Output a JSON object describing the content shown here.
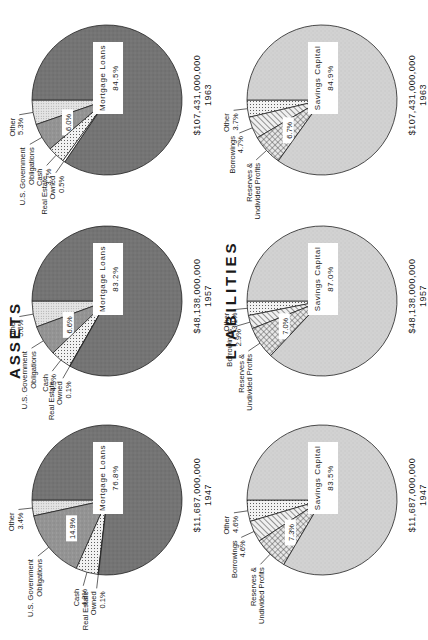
{
  "titles": {
    "assets": "ASSETS",
    "liabilities": "LIABILITIES"
  },
  "colors": {
    "mortgage": "#6e6e6e",
    "usgo": "#8f8f8f",
    "cash": "#e2e2e2",
    "real_estate": "#ffffff",
    "other_assets": "#d8d8d8",
    "savings": "#cfcfcf",
    "reserves": "#bdbdbd",
    "borrowings": "#d4d4d4",
    "other_liabilities": "#ececec",
    "outline": "#222222"
  },
  "years": [
    {
      "year": "1947",
      "total": "$11,687,000,000",
      "assets": [
        {
          "key": "other",
          "label": "Other",
          "value": 3.4,
          "text": "3.4%"
        },
        {
          "key": "usgo",
          "label": "U.S. Government Obligations",
          "value": 14.9,
          "text": "14.9%"
        },
        {
          "key": "cash",
          "label": "Cash",
          "value": 4.8,
          "text": "4.8%"
        },
        {
          "key": "real_estate",
          "label": "Real Estate Owned",
          "value": 0.1,
          "text": "0.1%"
        },
        {
          "key": "mortgage",
          "label": "Mortgage Loans",
          "value": 76.8,
          "text": "76.8%"
        }
      ],
      "liabilities": [
        {
          "key": "other",
          "label": "Other",
          "value": 4.6,
          "text": "4.6%"
        },
        {
          "key": "borrowings",
          "label": "Borrowings",
          "value": 4.6,
          "text": "4.6%"
        },
        {
          "key": "reserves",
          "label": "Reserves & Undivided Profits",
          "value": 7.3,
          "text": "7.3%"
        },
        {
          "key": "savings",
          "label": "Savings Capital",
          "value": 83.5,
          "text": "83.5%"
        }
      ]
    },
    {
      "year": "1957",
      "total": "$48,138,000,000",
      "assets": [
        {
          "key": "other",
          "label": "Other",
          "value": 5.6,
          "text": "5.6%"
        },
        {
          "key": "usgo",
          "label": "U.S. Government Obligations",
          "value": 6.6,
          "text": "6.6%"
        },
        {
          "key": "cash",
          "label": "Cash",
          "value": 4.5,
          "text": "4.5%"
        },
        {
          "key": "real_estate",
          "label": "Real Estate Owned",
          "value": 0.1,
          "text": "0.1%"
        },
        {
          "key": "mortgage",
          "label": "Mortgage Loans",
          "value": 83.2,
          "text": "83.2%"
        }
      ],
      "liabilities": [
        {
          "key": "other",
          "label": "Other",
          "value": 3.1,
          "text": "3.1%"
        },
        {
          "key": "borrowings",
          "label": "Borrowings",
          "value": 2.9,
          "text": "2.9%"
        },
        {
          "key": "reserves",
          "label": "Reserves & Undivided Profits",
          "value": 7.0,
          "text": "7.0%"
        },
        {
          "key": "savings",
          "label": "Savings Capital",
          "value": 87.0,
          "text": "87.0%"
        }
      ]
    },
    {
      "year": "1963",
      "total": "$107,431,000,000",
      "assets": [
        {
          "key": "other",
          "label": "Other",
          "value": 5.3,
          "text": "5.3%"
        },
        {
          "key": "usgo",
          "label": "U.S. Government Obligations",
          "value": 6.0,
          "text": "6.0%"
        },
        {
          "key": "cash",
          "label": "Cash",
          "value": 3.7,
          "text": "3.7%"
        },
        {
          "key": "real_estate",
          "label": "Real Estate Owned",
          "value": 0.5,
          "text": "0.5%"
        },
        {
          "key": "mortgage",
          "label": "Mortgage Loans",
          "value": 84.5,
          "text": "84.5%"
        }
      ],
      "liabilities": [
        {
          "key": "other",
          "label": "Other",
          "value": 3.7,
          "text": "3.7%"
        },
        {
          "key": "borrowings",
          "label": "Borrowings",
          "value": 4.7,
          "text": "4.7%"
        },
        {
          "key": "reserves",
          "label": "Reserves & Undivided Profits",
          "value": 6.7,
          "text": "6.7%"
        },
        {
          "key": "savings",
          "label": "Savings Capital",
          "value": 84.9,
          "text": "84.9%"
        }
      ]
    }
  ],
  "chart_data": [
    {
      "type": "pie",
      "title": "ASSETS",
      "subtitle": "1947 — $11,687,000,000",
      "categories": [
        "Mortgage Loans",
        "U.S. Government Obligations",
        "Cash",
        "Real Estate Owned",
        "Other"
      ],
      "values": [
        76.8,
        14.9,
        4.8,
        0.1,
        3.4
      ],
      "unit": "%"
    },
    {
      "type": "pie",
      "title": "ASSETS",
      "subtitle": "1957 — $48,138,000,000",
      "categories": [
        "Mortgage Loans",
        "U.S. Government Obligations",
        "Cash",
        "Real Estate Owned",
        "Other"
      ],
      "values": [
        83.2,
        6.6,
        4.5,
        0.1,
        5.6
      ],
      "unit": "%"
    },
    {
      "type": "pie",
      "title": "ASSETS",
      "subtitle": "1963 — $107,431,000,000",
      "categories": [
        "Mortgage Loans",
        "U.S. Government Obligations",
        "Cash",
        "Real Estate Owned",
        "Other"
      ],
      "values": [
        84.5,
        6.0,
        3.7,
        0.5,
        5.3
      ],
      "unit": "%"
    },
    {
      "type": "pie",
      "title": "LIABILITIES",
      "subtitle": "1947 — $11,687,000,000",
      "categories": [
        "Savings Capital",
        "Reserves & Undivided Profits",
        "Borrowings",
        "Other"
      ],
      "values": [
        83.5,
        7.3,
        4.6,
        4.6
      ],
      "unit": "%"
    },
    {
      "type": "pie",
      "title": "LIABILITIES",
      "subtitle": "1957 — $48,138,000,000",
      "categories": [
        "Savings Capital",
        "Reserves & Undivided Profits",
        "Borrowings",
        "Other"
      ],
      "values": [
        87.0,
        7.0,
        2.9,
        3.1
      ],
      "unit": "%"
    },
    {
      "type": "pie",
      "title": "LIABILITIES",
      "subtitle": "1963 — $107,431,000,000",
      "categories": [
        "Savings Capital",
        "Reserves & Undivided Profits",
        "Borrowings",
        "Other"
      ],
      "values": [
        84.9,
        6.7,
        4.7,
        3.7
      ],
      "unit": "%"
    }
  ]
}
